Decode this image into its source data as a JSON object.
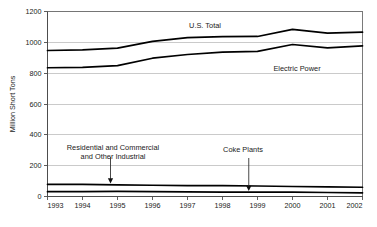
{
  "chart_data": {
    "type": "line",
    "title": "",
    "xlabel": "",
    "ylabel": "Million Short Tons",
    "x": [
      1993,
      1994,
      1995,
      1996,
      1997,
      1998,
      1999,
      2000,
      2001,
      2002
    ],
    "xtick_labels": [
      "1993",
      "1994",
      "1995",
      "1996",
      "1997",
      "1998",
      "1999",
      "2000",
      "2001",
      "2002"
    ],
    "xlim": [
      1993,
      2002
    ],
    "ylim": [
      0,
      1200
    ],
    "ytick_labels": [
      "0",
      "200",
      "400",
      "600",
      "800",
      "1000",
      "1200"
    ],
    "ytick_values": [
      0,
      200,
      400,
      600,
      800,
      1000,
      1200
    ],
    "grid": true,
    "legend_position": "inline-annotations",
    "series": [
      {
        "name": "U.S. Total",
        "label_text": "U.S. Total",
        "values": [
          947,
          951,
          962,
          1006,
          1030,
          1037,
          1038,
          1084,
          1060,
          1066
        ]
      },
      {
        "name": "Electric Power",
        "label_text": "Electric Power",
        "values": [
          835,
          838,
          849,
          897,
          921,
          937,
          941,
          986,
          964,
          977
        ]
      },
      {
        "name": "Residential and Commercial and Other Industrial",
        "label_text": "Residential and Commercial and Other Industrial",
        "values": [
          79,
          78,
          75,
          73,
          71,
          70,
          68,
          65,
          62,
          60
        ]
      },
      {
        "name": "Coke Plants",
        "label_text": "Coke Plants",
        "values": [
          31,
          31,
          33,
          32,
          30,
          28,
          28,
          29,
          26,
          24
        ]
      }
    ],
    "annotations": [
      {
        "id": "residential-annotation",
        "line1": "Residential and Commercial",
        "line2": "and Other Industrial",
        "target_year": 1994.8,
        "target_value": 85
      },
      {
        "id": "coke-plants-annotation",
        "line1": "Coke Plants",
        "line2": "",
        "target_year": 1998.75,
        "target_value": 36
      }
    ],
    "colors": {
      "line": "#000000",
      "grid": "#b3b3b3",
      "frame": "#6b6b6b",
      "text": "#1a1a1a",
      "background": "#ffffff"
    }
  }
}
